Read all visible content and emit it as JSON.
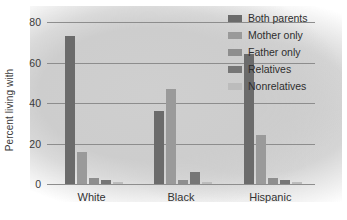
{
  "chart_data": {
    "type": "bar",
    "title": "",
    "xlabel": "",
    "ylabel": "Percent living with",
    "categories": [
      "White",
      "Black",
      "Hispanic"
    ],
    "ylim": [
      0,
      80
    ],
    "yticks": [
      0,
      20,
      40,
      60,
      80
    ],
    "ytick_labels": [
      "0",
      "20",
      "40",
      "60",
      "80"
    ],
    "grid": true,
    "legend_position": "top-right",
    "series": [
      {
        "name": "Both parents",
        "color": "#6b6b6b",
        "values": [
          73,
          36,
          64
        ]
      },
      {
        "name": "Mother only",
        "color": "#9a9a9a",
        "values": [
          16,
          47,
          24
        ]
      },
      {
        "name": "Father only",
        "color": "#8e8e8e",
        "values": [
          3,
          2,
          3
        ]
      },
      {
        "name": "Relatives",
        "color": "#767676",
        "values": [
          2,
          6,
          2
        ]
      },
      {
        "name": "Nonrelatives",
        "color": "#bcbcbc",
        "values": [
          1,
          1,
          1
        ]
      }
    ]
  }
}
